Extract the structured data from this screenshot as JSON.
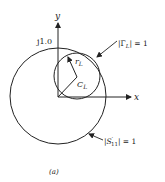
{
  "diagram": {
    "axes": {
      "x_label": "x",
      "y_label": "y",
      "y_tick_label": "j1.0"
    },
    "circles": {
      "large": {
        "label_prefix": "|S",
        "label_sup": "′",
        "label_sub": "11",
        "label_suffix": "| = 1"
      },
      "small": {
        "label_prefix": "|Γ",
        "label_sub": "L",
        "label_suffix": "| = 1"
      }
    },
    "center_label": {
      "main": "C",
      "sub": "L"
    },
    "radius_label": {
      "main": "r",
      "sub": "L"
    },
    "caption": "(a)",
    "colors": {
      "stroke": "#222222",
      "background": "#ffffff"
    }
  }
}
